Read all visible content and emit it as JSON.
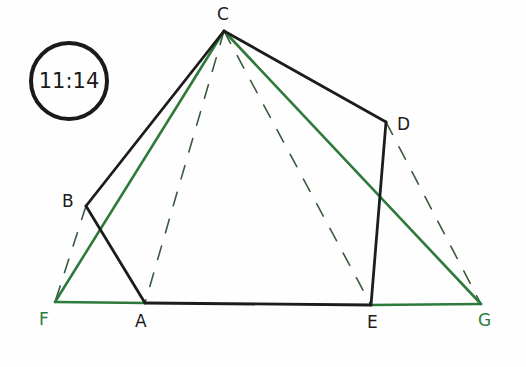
{
  "badge": {
    "text": "11:14"
  },
  "colors": {
    "black": "#1c1c1c",
    "green": "#2e7a3a",
    "dash": "#3a5a3e"
  },
  "points": {
    "A": {
      "label": "A",
      "x": 145,
      "y": 303,
      "lx": 135,
      "ly": 313,
      "color": "#1c1c1c"
    },
    "B": {
      "label": "B",
      "x": 86,
      "y": 206,
      "lx": 62,
      "ly": 193,
      "color": "#1c1c1c"
    },
    "C": {
      "label": "C",
      "x": 224,
      "y": 31,
      "lx": 217,
      "ly": 6,
      "color": "#1c1c1c"
    },
    "D": {
      "label": "D",
      "x": 386,
      "y": 122,
      "lx": 397,
      "ly": 116,
      "color": "#1c1c1c"
    },
    "E": {
      "label": "E",
      "x": 371,
      "y": 305,
      "lx": 367,
      "ly": 314,
      "color": "#1c1c1c"
    },
    "F": {
      "label": "F",
      "x": 55,
      "y": 302,
      "lx": 39,
      "ly": 311,
      "color": "#2e7a3a"
    },
    "G": {
      "label": "G",
      "x": 481,
      "y": 304,
      "lx": 478,
      "ly": 312,
      "color": "#2e7a3a"
    }
  },
  "segments": {
    "black_pentagon": [
      "C",
      "B",
      "A",
      "E",
      "D",
      "C"
    ],
    "green_solid": [
      [
        "C",
        "F"
      ],
      [
        "C",
        "G"
      ],
      [
        "F",
        "A"
      ],
      [
        "E",
        "G"
      ]
    ],
    "dashed": [
      [
        "C",
        "A"
      ],
      [
        "C",
        "E"
      ],
      [
        "B",
        "F"
      ],
      [
        "D",
        "G"
      ]
    ]
  }
}
